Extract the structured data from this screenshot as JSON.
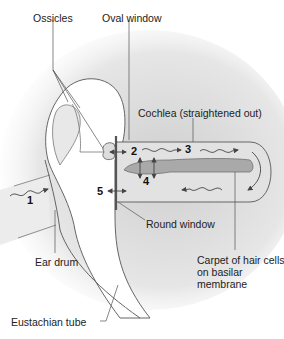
{
  "diagram": {
    "type": "anatomy-schematic",
    "colors": {
      "background": "#ffffff",
      "shade": "#d9d9d9",
      "cochlea_fill": "#e2e2e2",
      "membrane_fill": "#a9a9a9",
      "outline": "#555555",
      "text": "#222222"
    },
    "labels": {
      "ossicles": "Ossicles",
      "oval_window": "Oval window",
      "cochlea": "Cochlea (straightened out)",
      "round_window": "Round window",
      "ear_drum": "Ear drum",
      "hair_cells": "Carpet of hair cells on basilar membrane",
      "eustachian_tube": "Eustachian tube"
    },
    "steps": {
      "s1": "1",
      "s2": "2",
      "s3": "3",
      "s4": "4",
      "s5": "5"
    }
  }
}
